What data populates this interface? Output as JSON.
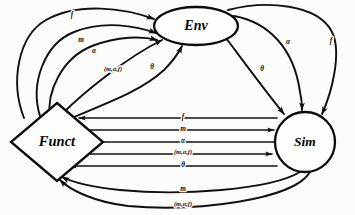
{
  "diagram": {
    "background_color": "#fcfcfa",
    "stroke_color": "#101010",
    "nodes": [
      {
        "id": "env",
        "label": "Env",
        "shape": "ellipse",
        "cx": 196,
        "cy": 26,
        "rx": 42,
        "ry": 19
      },
      {
        "id": "funct",
        "label": "Funct",
        "shape": "diamond",
        "cx": 57,
        "cy": 142,
        "rx": 46,
        "ry": 39
      },
      {
        "id": "sim",
        "label": "Sim",
        "shape": "circle",
        "cx": 305,
        "cy": 142,
        "r": 30
      }
    ],
    "edge_labels": {
      "f": "f",
      "m": "m",
      "alpha": "α",
      "theta": "θ",
      "tuple": "(m,α,f)"
    },
    "edges": [
      {
        "id": "funct-env-f",
        "from": "funct",
        "to": "env",
        "label": "f",
        "route": "outer-left-loop"
      },
      {
        "id": "funct-env-m",
        "from": "funct",
        "to": "env",
        "label": "m",
        "route": "left-loop"
      },
      {
        "id": "funct-env-alpha",
        "from": "funct",
        "to": "env",
        "label": "α",
        "route": "left-curve"
      },
      {
        "id": "funct-env-tuple",
        "from": "funct",
        "to": "env",
        "label": "(m,α,f)",
        "route": "left-diagonal"
      },
      {
        "id": "funct-env-theta",
        "from": "funct",
        "to": "env",
        "label": "θ",
        "route": "left-inner"
      },
      {
        "id": "env-sim-theta",
        "from": "env",
        "to": "sim",
        "label": "θ",
        "route": "right-diagonal"
      },
      {
        "id": "env-sim-alpha",
        "from": "env",
        "to": "sim",
        "label": "α",
        "route": "right-curve"
      },
      {
        "id": "env-sim-f",
        "from": "env",
        "to": "sim",
        "label": "f",
        "route": "outer-right-loop"
      },
      {
        "id": "sim-funct-f",
        "from": "sim",
        "to": "funct",
        "label": "f",
        "route": "horizontal-1"
      },
      {
        "id": "funct-sim-m",
        "from": "funct",
        "to": "sim",
        "label": "m",
        "route": "horizontal-2"
      },
      {
        "id": "sim-funct-alpha",
        "from": "sim",
        "to": "funct",
        "label": "α",
        "route": "horizontal-3"
      },
      {
        "id": "funct-sim-tuple",
        "from": "funct",
        "to": "sim",
        "label": "(m,α,f)",
        "route": "horizontal-4"
      },
      {
        "id": "sim-funct-theta",
        "from": "sim",
        "to": "funct",
        "label": "θ",
        "route": "horizontal-5"
      },
      {
        "id": "sim-funct-m",
        "from": "sim",
        "to": "funct",
        "label": "m",
        "route": "bottom-curve-1"
      },
      {
        "id": "sim-funct-tuple",
        "from": "sim",
        "to": "funct",
        "label": "(m,α,f)",
        "route": "bottom-curve-2"
      }
    ]
  }
}
